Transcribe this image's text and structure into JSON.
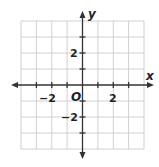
{
  "diagram": {
    "type": "coordinate-plane",
    "x_axis_label": "x",
    "y_axis_label": "y",
    "origin_label": "O",
    "range": {
      "x": [
        -4,
        4
      ],
      "y": [
        -4,
        4
      ]
    },
    "grid_step": 1,
    "tick_labels": {
      "x_neg": "−2",
      "x_pos": "2",
      "y_pos": "2",
      "y_neg": "−2"
    },
    "colors": {
      "grid": "#d0d0d0",
      "axis": "#333333",
      "text": "#222222"
    }
  }
}
